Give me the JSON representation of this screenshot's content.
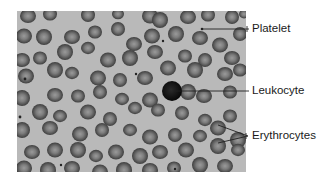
{
  "figure": {
    "kind": "blood smear micrograph",
    "colors": {
      "page_background": "#ffffff",
      "smear_background": "#b9b9b9",
      "erythrocyte_rim": "#4a4a4a",
      "erythrocyte_center": "#8a8a8a",
      "leukocyte": "#111111",
      "leader_line": "#222222",
      "label_text": "#1a1a1a"
    },
    "micrograph": {
      "x": 17,
      "y": 11,
      "width": 229,
      "height": 161
    },
    "labels": [
      {
        "id": "platelet",
        "text": "Platelet",
        "x": 252,
        "y": 24
      },
      {
        "id": "leukocyte",
        "text": "Leukocyte",
        "x": 252,
        "y": 86
      },
      {
        "id": "erythrocytes",
        "text": "Erythrocytes",
        "x": 252,
        "y": 131
      }
    ]
  }
}
